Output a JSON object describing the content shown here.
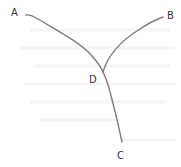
{
  "diagram": {
    "type": "tree",
    "nodes": [
      {
        "id": "A",
        "label": "A",
        "x": 14,
        "y": 15
      },
      {
        "id": "B",
        "label": "B",
        "x": 170,
        "y": 17
      },
      {
        "id": "D",
        "label": "D",
        "x": 93,
        "y": 82
      },
      {
        "id": "C",
        "label": "C",
        "x": 121,
        "y": 158
      }
    ],
    "edges": [
      {
        "from": "A",
        "to": "D"
      },
      {
        "from": "B",
        "to": "D"
      },
      {
        "from": "D",
        "to": "C"
      }
    ],
    "colors": {
      "edge": "#7d7d7d",
      "label": "#333333",
      "background": "#ffffff"
    }
  }
}
